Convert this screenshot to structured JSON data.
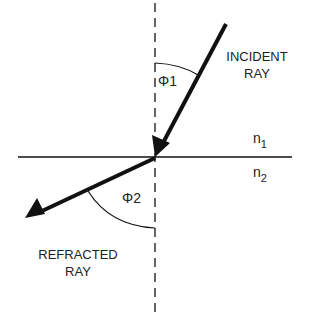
{
  "labels": {
    "incident": [
      "INCIDENT",
      "RAY"
    ],
    "refracted": [
      "REFRACTED",
      "RAY"
    ],
    "phi1": "Φ1",
    "phi2": "Φ2",
    "n1": {
      "base": "n",
      "sub": "1"
    },
    "n2": {
      "base": "n",
      "sub": "2"
    }
  },
  "colors": {
    "line": "#111111",
    "text": "#222222"
  }
}
